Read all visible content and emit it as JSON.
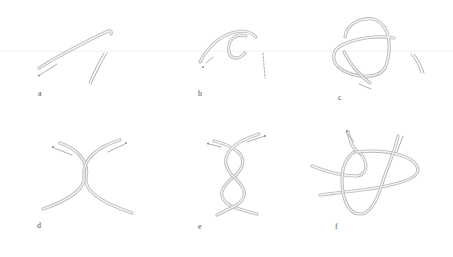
{
  "figure": {
    "panels": [
      {
        "id": "a",
        "label": "a",
        "shape": "single curved strand with separate short segment"
      },
      {
        "id": "b",
        "label": "b",
        "shape": "strand forming a C-shaped loop"
      },
      {
        "id": "c",
        "label": "c",
        "shape": "strand forming a full overhand loop"
      },
      {
        "id": "d",
        "label": "d",
        "shape": "two strands crossing once"
      },
      {
        "id": "e",
        "label": "e",
        "shape": "two strands twisted twice (double twist)"
      },
      {
        "id": "f",
        "label": "f",
        "shape": "strands interlaced into final knot with loop"
      }
    ],
    "colors": {
      "rope_outline": "#b9b9b9",
      "rope_fill": "#f4f4f4",
      "label": "#555555",
      "background": "#ffffff"
    }
  }
}
